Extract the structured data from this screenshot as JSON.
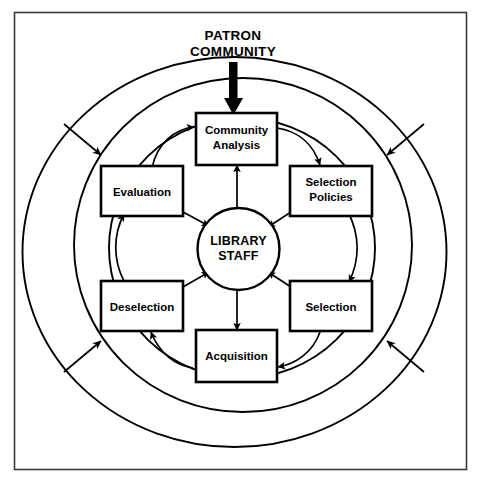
{
  "diagram": {
    "title": "PATRON COMMUNITY",
    "title_lines": [
      "PATRON",
      "COMMUNITY"
    ],
    "center": {
      "label": "LIBRARY STAFF",
      "lines": [
        "LIBRARY",
        "STAFF"
      ]
    },
    "rings": [
      {
        "name": "outer-ring",
        "label": ""
      },
      {
        "name": "middle-ring",
        "label": ""
      },
      {
        "name": "inner-ring",
        "label": ""
      }
    ],
    "nodes": [
      {
        "id": "community-analysis",
        "lines": [
          "Community",
          "Analysis"
        ],
        "label": "Community Analysis"
      },
      {
        "id": "selection-policies",
        "lines": [
          "Selection",
          "Policies"
        ],
        "label": "Selection Policies"
      },
      {
        "id": "selection",
        "lines": [
          "Selection"
        ],
        "label": "Selection"
      },
      {
        "id": "acquisition",
        "lines": [
          "Acquisition"
        ],
        "label": "Acquisition"
      },
      {
        "id": "deselection",
        "lines": [
          "Deselection"
        ],
        "label": "Deselection"
      },
      {
        "id": "evaluation",
        "lines": [
          "Evaluation"
        ],
        "label": "Evaluation"
      }
    ],
    "colors": {
      "stroke": "#000000",
      "background": "#ffffff",
      "frame": "#3a3a3a"
    }
  }
}
